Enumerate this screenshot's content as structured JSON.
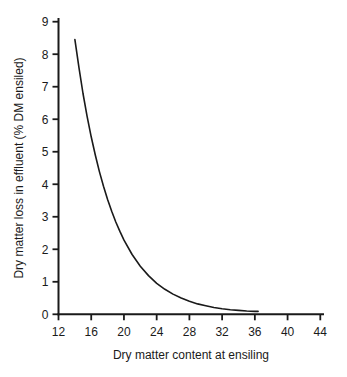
{
  "figure": {
    "background": "#ffffff",
    "axis_color": "#1a1a1a",
    "line_color": "#1a1a1a"
  },
  "chart_data": {
    "type": "line",
    "title": "",
    "xlabel": "Dry matter content at ensiling",
    "ylabel": "Dry matter loss in effluent (% DM ensiled)",
    "xlim": [
      12,
      44
    ],
    "ylim": [
      0,
      9
    ],
    "x_ticks": [
      12,
      16,
      20,
      24,
      28,
      32,
      36,
      40,
      44
    ],
    "y_ticks": [
      0,
      1,
      2,
      3,
      4,
      5,
      6,
      7,
      8,
      9
    ],
    "grid": false,
    "legend": "none",
    "series": [
      {
        "name": "dry-matter-loss-curve",
        "color": "#1a1a1a",
        "x": [
          14,
          14.5,
          15,
          15.5,
          16,
          16.5,
          17,
          17.5,
          18,
          18.5,
          19,
          19.5,
          20,
          21,
          22,
          23,
          24,
          25,
          26,
          27,
          28,
          29,
          30,
          31,
          32,
          33,
          34,
          35,
          36,
          36.4
        ],
        "y": [
          8.45,
          7.58,
          6.79,
          6.09,
          5.46,
          4.9,
          4.39,
          3.94,
          3.53,
          3.17,
          2.84,
          2.55,
          2.28,
          1.84,
          1.48,
          1.19,
          0.95,
          0.77,
          0.62,
          0.5,
          0.4,
          0.32,
          0.26,
          0.21,
          0.17,
          0.14,
          0.12,
          0.1,
          0.09,
          0.09
        ]
      }
    ]
  }
}
